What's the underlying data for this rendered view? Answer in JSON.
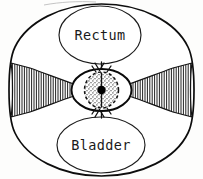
{
  "figure": {
    "kind": "anatomical-cross-section-diagram",
    "width": 203,
    "height": 179,
    "background_color": "#fdfdfc",
    "ink_color": "#111111"
  },
  "labels": {
    "rectum": "Rectum",
    "bladder": "Bladder"
  },
  "structures": {
    "outer_body": {
      "name": "body-outline",
      "shape": "rounded-circle",
      "cx": 101.5,
      "cy": 90,
      "rx": 92,
      "ry": 86,
      "stroke": "#0d0d0d"
    },
    "rectum_oval": {
      "name": "rectum-oval",
      "cx": 100,
      "cy": 35,
      "rx": 41,
      "ry": 29,
      "stroke": "#1c1c1c",
      "fill": "#ffffff"
    },
    "bladder_oval": {
      "name": "bladder-oval",
      "cx": 101,
      "cy": 145,
      "rx": 44,
      "ry": 28,
      "stroke": "#1c1c1c",
      "fill": "#ffffff"
    },
    "central_canal": {
      "name": "central-canal",
      "cx": 101.5,
      "cy": 90,
      "rx": 30,
      "ry": 21,
      "stroke": "#0a0a0a"
    },
    "inner_dashed_canal": {
      "name": "inner-canal",
      "cx": 101.5,
      "cy": 90,
      "rx": 17,
      "ry": 18,
      "stroke": "#121212",
      "dash": "3.1 2.5",
      "fill_texture": "stipple"
    },
    "center_point": {
      "name": "center-point",
      "cx": 101.5,
      "cy": 90,
      "r": 4.2,
      "fill": "#000000"
    },
    "left_wing": {
      "name": "left-hatched-wing",
      "orientation": "left",
      "hatching": "vertical",
      "hatch_count": 26,
      "stroke": "#161616"
    },
    "right_wing": {
      "name": "right-hatched-wing",
      "orientation": "right",
      "hatching": "vertical",
      "hatch_count": 26,
      "stroke": "#161616"
    },
    "top_chevrons": {
      "name": "top-chevron-marks",
      "count": 2
    },
    "bottom_chevrons": {
      "name": "bottom-chevron-marks",
      "count": 2
    }
  }
}
